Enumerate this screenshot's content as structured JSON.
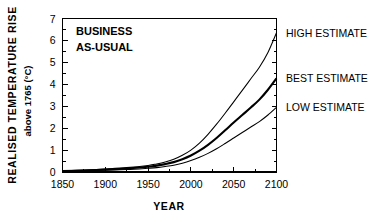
{
  "chart_data": {
    "type": "line",
    "title": "",
    "annotation": [
      "BUSINESS",
      "AS-USUAL"
    ],
    "xlabel": "YEAR",
    "ylabel": "REALISED TEMPERATURE RISE",
    "ylabel_sub": "above 1765 (°C)",
    "xlim": [
      1850,
      2100
    ],
    "ylim": [
      0,
      7
    ],
    "xticks": [
      1850,
      1900,
      1950,
      2000,
      2050,
      2100
    ],
    "xticklabels": [
      "1850",
      "1900",
      "1950",
      "2000",
      "2050",
      "2100"
    ],
    "yticks": [
      0,
      1,
      2,
      3,
      4,
      5,
      6,
      7
    ],
    "yticklabels": [
      "0",
      "1",
      "2",
      "3",
      "4",
      "5",
      "6",
      "7"
    ],
    "yminorticks": [
      0.5,
      1.5,
      2.5,
      3.5,
      4.5,
      5.5,
      6.5
    ],
    "xminorticks": [
      1875,
      1925,
      1975,
      2025,
      2075
    ],
    "grid": false,
    "legend_position": "right-inline",
    "x": [
      1850,
      1875,
      1900,
      1925,
      1950,
      1960,
      1970,
      1980,
      1990,
      2000,
      2010,
      2020,
      2030,
      2040,
      2050,
      2060,
      2070,
      2080,
      2090,
      2100
    ],
    "series": [
      {
        "name": "HIGH ESTIMATE",
        "label": "HIGH ESTIMATE",
        "style": "thin",
        "end_value": 6.35,
        "values": [
          0.05,
          0.09,
          0.14,
          0.2,
          0.3,
          0.37,
          0.46,
          0.58,
          0.76,
          1.0,
          1.32,
          1.72,
          2.18,
          2.68,
          3.2,
          3.72,
          4.25,
          4.78,
          5.45,
          6.35
        ]
      },
      {
        "name": "BEST ESTIMATE",
        "label": "BEST ESTIMATE",
        "style": "thick",
        "end_value": 4.27,
        "values": [
          0.04,
          0.07,
          0.11,
          0.16,
          0.24,
          0.29,
          0.36,
          0.45,
          0.58,
          0.75,
          0.97,
          1.24,
          1.55,
          1.9,
          2.26,
          2.6,
          2.94,
          3.3,
          3.75,
          4.27
        ]
      },
      {
        "name": "LOW ESTIMATE",
        "label": "LOW ESTIMATE",
        "style": "thin",
        "end_value": 2.95,
        "values": [
          0.03,
          0.05,
          0.08,
          0.11,
          0.17,
          0.2,
          0.25,
          0.31,
          0.4,
          0.52,
          0.67,
          0.85,
          1.06,
          1.3,
          1.55,
          1.8,
          2.05,
          2.3,
          2.6,
          2.95
        ]
      }
    ],
    "colors": {
      "axis": "#000000",
      "curve": "#000000",
      "background": "#ffffff"
    }
  }
}
